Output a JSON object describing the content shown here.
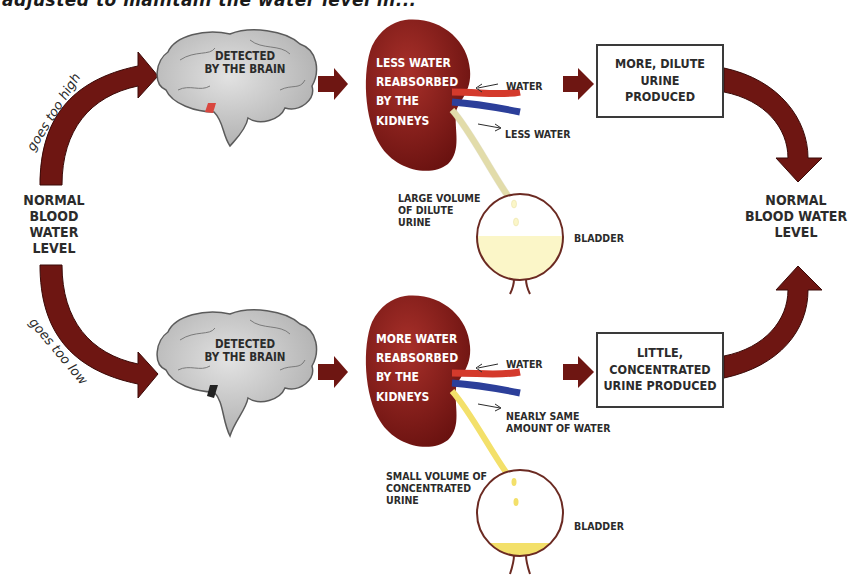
{
  "heading": "adjusted to maintain the water level in...",
  "colors": {
    "arrow": "#6e1612",
    "kidney": "#8c1c1a",
    "brain": "#c9c9c9",
    "artery": "#d43a2c",
    "vein": "#2c3f9a",
    "dilute_urine": "#fbf6c8",
    "concentrated_urine": "#f3e06a",
    "box_border": "#3a3a3a"
  },
  "left": {
    "label": [
      "NORMAL",
      "BLOOD WATER",
      "LEVEL"
    ],
    "up_branch": "goes too high",
    "down_branch": "goes too low"
  },
  "right": {
    "label": [
      "NORMAL",
      "BLOOD WATER",
      "LEVEL"
    ]
  },
  "top_path": {
    "brain_label": [
      "DETECTED",
      "BY THE BRAIN"
    ],
    "kidney_label": [
      "LESS WATER",
      "REABSORBED",
      "BY THE",
      "KIDNEYS"
    ],
    "water_in": "WATER",
    "water_out": "LESS WATER",
    "urine_label": [
      "LARGE VOLUME",
      "OF DILUTE",
      "URINE"
    ],
    "bladder": "BLADDER",
    "result_box": [
      "MORE, DILUTE",
      "URINE",
      "PRODUCED"
    ]
  },
  "bottom_path": {
    "brain_label": [
      "DETECTED",
      "BY THE BRAIN"
    ],
    "kidney_label": [
      "MORE WATER",
      "REABSORBED",
      "BY THE",
      "KIDNEYS"
    ],
    "water_in": "WATER",
    "water_out": [
      "NEARLY SAME",
      "AMOUNT OF WATER"
    ],
    "urine_label": [
      "SMALL VOLUME OF",
      "CONCENTRATED",
      "URINE"
    ],
    "bladder": "BLADDER",
    "result_box": [
      "LITTLE,",
      "CONCENTRATED",
      "URINE PRODUCED"
    ]
  }
}
